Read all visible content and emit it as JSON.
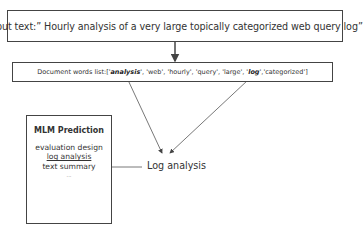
{
  "input": {
    "text": "Input text:”  Hourly analysis of a very large topically categorized web query log”"
  },
  "words_list": {
    "prefix": "Document words list:['",
    "items": [
      {
        "text": "analysis",
        "highlight": true
      },
      {
        "text": "web",
        "highlight": false
      },
      {
        "text": "hourly",
        "highlight": false
      },
      {
        "text": "query",
        "highlight": false
      },
      {
        "text": "large",
        "highlight": false
      },
      {
        "text": "log",
        "highlight": true
      },
      {
        "text": "categorized",
        "highlight": false
      }
    ]
  },
  "mlm": {
    "title": "MLM Prediction",
    "predictions": [
      "evaluation design",
      "log analysis",
      "text summary",
      "..."
    ],
    "selected_index": 1
  },
  "result": {
    "label": "Log analysis"
  },
  "colors": {
    "stroke": "#444444",
    "text": "#333333"
  }
}
